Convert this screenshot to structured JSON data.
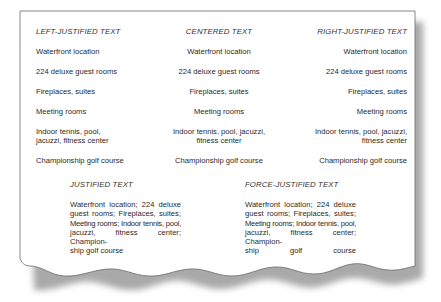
{
  "columns": [
    {
      "id": "left",
      "heading": "LEFT-JUSTIFIED TEXT",
      "items": [
        "Waterfront location",
        "224 deluxe guest rooms",
        "Fireplaces, suites",
        "Meeting rooms",
        [
          "Indoor tennis, pool,",
          "jacuzzi, fitness center"
        ],
        "Championship golf course"
      ]
    },
    {
      "id": "center",
      "heading": "CENTERED TEXT",
      "items": [
        "Waterfront location",
        "224 deluxe guest rooms",
        "Fireplaces, suites",
        "Meeting rooms",
        [
          "Indoor tennis, pool, jacuzzi,",
          "fitness center"
        ],
        "Championship golf course"
      ]
    },
    {
      "id": "right",
      "heading": "RIGHT-JUSTIFIED TEXT",
      "items": [
        "Waterfront location",
        "224 deluxe guest rooms",
        "Fireplaces, suites",
        "Meeting rooms",
        [
          "Indoor tennis, pool, jacuzzi,",
          "fitness center"
        ],
        "Championship golf course"
      ]
    }
  ],
  "left": {
    "heading": "LEFT-JUSTIFIED TEXT",
    "i0": "Waterfront location",
    "i1": "224 deluxe guest rooms",
    "i2": "Fireplaces, suites",
    "i3": "Meeting rooms",
    "i4a": "Indoor tennis, pool,",
    "i4b": "jacuzzi, fitness center",
    "i5": "Championship golf course"
  },
  "center": {
    "heading": "CENTERED TEXT",
    "i0": "Waterfront location",
    "i1": "224 deluxe guest rooms",
    "i2": "Fireplaces, suites",
    "i3": "Meeting rooms",
    "i4a": "Indoor tennis, pool, jacuzzi,",
    "i4b": "fitness center",
    "i5": "Championship golf course"
  },
  "right": {
    "heading": "RIGHT-JUSTIFIED TEXT",
    "i0": "Waterfront location",
    "i1": "224 deluxe guest rooms",
    "i2": "Fireplaces, suites",
    "i3": "Meeting rooms",
    "i4a": "Indoor tennis, pool, jacuzzi,",
    "i4b": "fitness center",
    "i5": "Championship golf course"
  },
  "justified": {
    "heading": "JUSTIFIED TEXT",
    "body": "Waterfront location; 224 deluxe guest rooms; Fireplaces, suites; Meeting rooms; Indoor tennis, pool, jacuzzi, fitness center; Champion-ship golf course",
    "line1": "Waterfront location; 224 deluxe",
    "line2": "guest rooms; Fireplaces, suites;",
    "line3": "Meeting rooms; Indoor tennis, pool,",
    "line4": "jacuzzi, fitness center; Champion-",
    "line5": "ship golf course"
  },
  "force_justified": {
    "heading": "FORCE-JUSTIFIED TEXT",
    "line1": "Waterfront location; 224 deluxe",
    "line2": "guest rooms; Fireplaces, suites;",
    "line3": "Meeting rooms; Indoor tennis, pool,",
    "line4": "jacuzzi, fitness center; Champion-",
    "last_words": [
      "ship",
      "golf",
      "course"
    ]
  },
  "colors": {
    "paper": "#ffffff",
    "border": "#6a6a6a",
    "shadow": "#9a9a9a",
    "text": "#2a2a2a"
  }
}
